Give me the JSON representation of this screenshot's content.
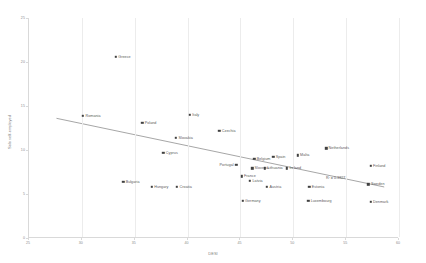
{
  "chart_data": {
    "type": "scatter",
    "title": "",
    "xlabel": "DESI",
    "ylabel": "Solo self-employed",
    "xlim": [
      25,
      60
    ],
    "ylim": [
      0,
      25
    ],
    "xticks": [
      25,
      30,
      35,
      40,
      45,
      50,
      55,
      60
    ],
    "yticks": [
      0,
      5,
      10,
      15,
      20,
      25
    ],
    "grid": true,
    "legend": false,
    "annotations": [
      {
        "text": "R² = 0.3827",
        "x": 54.1,
        "y": 6.8
      }
    ],
    "trendline": {
      "type": "linear",
      "r_squared": 0.3827,
      "x_start": 27.6,
      "y_start": 13.6,
      "x_end": 58.6,
      "y_end": 5.8
    },
    "points": [
      {
        "label": "Greece",
        "x": 33.3,
        "y": 20.6,
        "label_pos": "right"
      },
      {
        "label": "Romania",
        "x": 30.2,
        "y": 13.9,
        "label_pos": "right"
      },
      {
        "label": "Italy",
        "x": 40.3,
        "y": 14.0,
        "label_pos": "right"
      },
      {
        "label": "Poland",
        "x": 35.8,
        "y": 13.1,
        "label_pos": "right"
      },
      {
        "label": "Czechia",
        "x": 43.1,
        "y": 12.2,
        "label_pos": "right"
      },
      {
        "label": "Slovakia",
        "x": 39.0,
        "y": 11.4,
        "label_pos": "right"
      },
      {
        "label": "Cyprus",
        "x": 37.8,
        "y": 9.7,
        "label_pos": "right"
      },
      {
        "label": "Netherlands",
        "x": 53.2,
        "y": 10.2,
        "label_pos": "right"
      },
      {
        "label": "Malta",
        "x": 50.5,
        "y": 9.4,
        "label_pos": "right"
      },
      {
        "label": "Spain",
        "x": 48.2,
        "y": 9.2,
        "label_pos": "right"
      },
      {
        "label": "Belgium",
        "x": 46.4,
        "y": 9.0,
        "label_pos": "right"
      },
      {
        "label": "Portugal",
        "x": 44.7,
        "y": 8.3,
        "label_pos": "left"
      },
      {
        "label": "Slovenia",
        "x": 46.2,
        "y": 7.9,
        "label_pos": "right"
      },
      {
        "label": "Lithuania",
        "x": 47.4,
        "y": 7.9,
        "label_pos": "right"
      },
      {
        "label": "Ireland",
        "x": 49.5,
        "y": 7.9,
        "label_pos": "right"
      },
      {
        "label": "Finland",
        "x": 57.4,
        "y": 8.2,
        "label_pos": "right"
      },
      {
        "label": "France",
        "x": 45.2,
        "y": 7.0,
        "label_pos": "right"
      },
      {
        "label": "Latvia",
        "x": 46.0,
        "y": 6.5,
        "label_pos": "right"
      },
      {
        "label": "Bulgaria",
        "x": 34.0,
        "y": 6.4,
        "label_pos": "right"
      },
      {
        "label": "Hungary",
        "x": 36.7,
        "y": 5.8,
        "label_pos": "right"
      },
      {
        "label": "Croatia",
        "x": 39.1,
        "y": 5.8,
        "label_pos": "right"
      },
      {
        "label": "Austria",
        "x": 47.6,
        "y": 5.8,
        "label_pos": "right"
      },
      {
        "label": "Estonia",
        "x": 51.6,
        "y": 5.8,
        "label_pos": "right"
      },
      {
        "label": "Sweden",
        "x": 57.2,
        "y": 6.1,
        "label_pos": "right"
      },
      {
        "label": "Germany",
        "x": 45.3,
        "y": 4.2,
        "label_pos": "right"
      },
      {
        "label": "Luxembourg",
        "x": 51.5,
        "y": 4.2,
        "label_pos": "right"
      },
      {
        "label": "Denmark",
        "x": 57.4,
        "y": 4.1,
        "label_pos": "right"
      }
    ]
  }
}
